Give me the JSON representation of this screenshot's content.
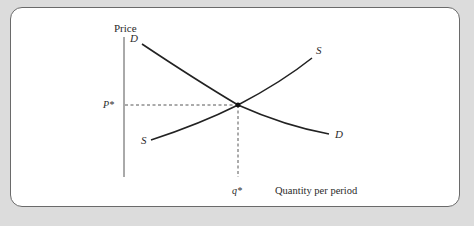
{
  "figure": {
    "type": "supply-demand diagram",
    "axes": {
      "y_label": "Price",
      "x_label": "Quantity per period"
    },
    "curves": [
      {
        "name": "demand",
        "label_top": "D",
        "label_bottom": "D"
      },
      {
        "name": "supply",
        "label_top": "S",
        "label_bottom": "S"
      }
    ],
    "equilibrium": {
      "price_label": "P*",
      "quantity_label": "q*"
    }
  },
  "labels": {
    "price": "Price",
    "quantity": "Quantity per period",
    "demand_top": "D",
    "demand_bottom": "D",
    "supply_top": "S",
    "supply_bottom": "S",
    "p_star": "P*",
    "q_star": "q*"
  },
  "colors": {
    "background": "#dcdcdc",
    "card": "#ffffff",
    "card_border": "#6a6a6a",
    "curve": "#222222",
    "axis": "#555555",
    "x_axis_tint": "#7dbf6e",
    "dashed": "#444444"
  }
}
